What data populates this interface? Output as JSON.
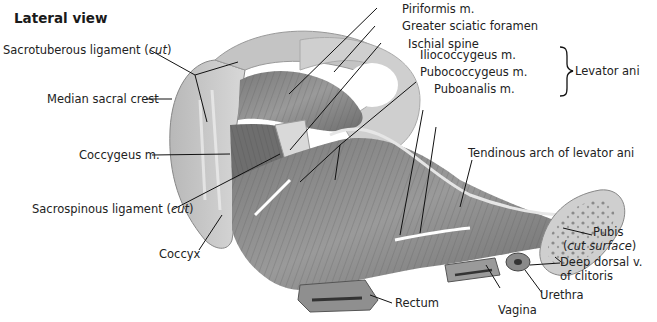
{
  "figure": {
    "title": "Lateral view",
    "labels": {
      "sacrotuberous": {
        "text": "Sacrotuberous ligament (",
        "italic": "cut",
        "close": ")"
      },
      "median_sacral_crest": "Median sacral crest",
      "coccygeus": "Coccygeus m.",
      "sacrospinous": {
        "text": "Sacrospinous ligament (",
        "italic": "cut",
        "close": ")"
      },
      "coccyx": "Coccyx",
      "piriformis": "Piriformis m.",
      "greater_sciatic_foramen": "Greater sciatic foramen",
      "ischial_spine": "Ischial spine",
      "iliococcygeus": "Iliococcygeus m.",
      "pubococcygeus": "Pubococcygeus m.",
      "puboanalis": "Puboanalis m.",
      "levator_ani": "Levator ani",
      "tendinous_arch": "Tendinous arch of levator ani",
      "pubis": "Pubis",
      "pubis_cut": "cut surface",
      "deep_dorsal_1": "Deep dorsal v.",
      "deep_dorsal_2": "of clitoris",
      "urethra": "Urethra",
      "vagina": "Vagina",
      "rectum": "Rectum"
    }
  }
}
